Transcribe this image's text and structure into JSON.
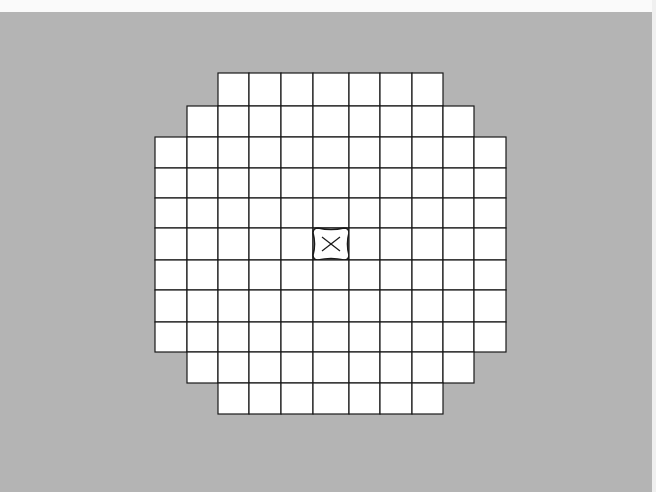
{
  "figure": {
    "background_color": "#b4b4b4",
    "cell_color": "#ffffff",
    "line_color": "#1a1a1a",
    "columns_x": [
      155,
      187,
      218,
      249,
      281,
      313,
      349,
      380,
      412,
      443,
      474,
      506
    ],
    "rows_y": [
      73,
      106,
      137,
      168,
      198,
      228,
      260,
      290,
      322,
      352,
      383,
      414
    ],
    "row_spans": [
      {
        "row": 0,
        "from_col": 2,
        "to_col": 8
      },
      {
        "row": 1,
        "from_col": 1,
        "to_col": 9
      },
      {
        "row": 2,
        "from_col": 0,
        "to_col": 10
      },
      {
        "row": 3,
        "from_col": 0,
        "to_col": 10
      },
      {
        "row": 4,
        "from_col": 0,
        "to_col": 10
      },
      {
        "row": 5,
        "from_col": 0,
        "to_col": 10
      },
      {
        "row": 6,
        "from_col": 0,
        "to_col": 10
      },
      {
        "row": 7,
        "from_col": 0,
        "to_col": 10
      },
      {
        "row": 8,
        "from_col": 0,
        "to_col": 10
      },
      {
        "row": 9,
        "from_col": 1,
        "to_col": 9
      },
      {
        "row": 10,
        "from_col": 2,
        "to_col": 8
      }
    ],
    "marked_cell": {
      "row": 5,
      "col": 5,
      "marker": "X"
    }
  }
}
